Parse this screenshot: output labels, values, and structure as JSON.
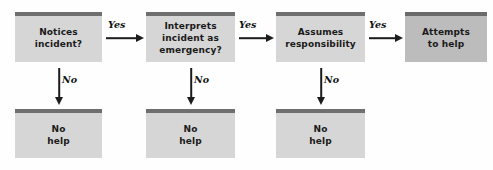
{
  "diagram": {
    "background_color": "#fefefe",
    "node_fill": "#d6d6d6",
    "node_fill_terminal": "#bcbcbc",
    "node_top_bar_color": "#6f6f6f",
    "arrow_color": "#1c1c1c",
    "text_color": "#1a1a1a"
  },
  "nodes": {
    "decision_1": {
      "label": "Notices\nincident?"
    },
    "decision_2": {
      "label": "Interprets\nincident as\nemergency?"
    },
    "decision_3": {
      "label": "Assumes\nresponsibility"
    },
    "outcome_help": {
      "label": "Attempts\nto help"
    },
    "outcome_no_help_1": {
      "label": "No\nhelp"
    },
    "outcome_no_help_2": {
      "label": "No\nhelp"
    },
    "outcome_no_help_3": {
      "label": "No\nhelp"
    }
  },
  "edges": {
    "yes_1": {
      "label": "Yes"
    },
    "yes_2": {
      "label": "Yes"
    },
    "yes_3": {
      "label": "Yes"
    },
    "no_1": {
      "label": "No"
    },
    "no_2": {
      "label": "No"
    },
    "no_3": {
      "label": "No"
    }
  }
}
